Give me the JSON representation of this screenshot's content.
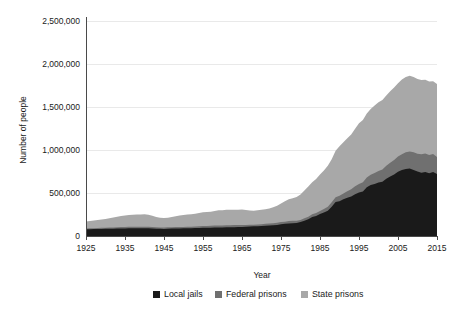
{
  "chart_data": {
    "type": "area",
    "stacked": true,
    "title": "",
    "xlabel": "Year",
    "ylabel": "Number of people",
    "xlim": [
      1925,
      2015
    ],
    "ylim": [
      0,
      2500000
    ],
    "grid": true,
    "legend_position": "bottom",
    "ytick_labels": [
      "2,500,000",
      "2,000,000",
      "1,500,000",
      "1,000,000",
      "500,000",
      "0"
    ],
    "ytick_values": [
      2500000,
      2000000,
      1500000,
      1000000,
      500000,
      0
    ],
    "xtick_labels": [
      "1925",
      "1935",
      "1945",
      "1955",
      "1965",
      "1975",
      "1985",
      "1995",
      "2005",
      "2015"
    ],
    "xtick_values": [
      1925,
      1935,
      1945,
      1955,
      1965,
      1975,
      1985,
      1995,
      2005,
      2015
    ],
    "x": [
      1925,
      1926,
      1927,
      1928,
      1929,
      1930,
      1931,
      1932,
      1933,
      1934,
      1935,
      1936,
      1937,
      1938,
      1939,
      1940,
      1941,
      1942,
      1943,
      1944,
      1945,
      1946,
      1947,
      1948,
      1949,
      1950,
      1951,
      1952,
      1953,
      1954,
      1955,
      1956,
      1957,
      1958,
      1959,
      1960,
      1961,
      1962,
      1963,
      1964,
      1965,
      1966,
      1967,
      1968,
      1969,
      1970,
      1971,
      1972,
      1973,
      1974,
      1975,
      1976,
      1977,
      1978,
      1979,
      1980,
      1981,
      1982,
      1983,
      1984,
      1985,
      1986,
      1987,
      1988,
      1989,
      1990,
      1991,
      1992,
      1993,
      1994,
      1995,
      1996,
      1997,
      1998,
      1999,
      2000,
      2001,
      2002,
      2003,
      2004,
      2005,
      2006,
      2007,
      2008,
      2009,
      2010,
      2011,
      2012,
      2013,
      2014,
      2015
    ],
    "series": [
      {
        "name": "Local jails",
        "color": "#1a1a1a",
        "values": [
          78000,
          79000,
          80000,
          81000,
          82000,
          83000,
          84000,
          85000,
          86000,
          87000,
          88000,
          89000,
          90000,
          90000,
          90000,
          90000,
          89000,
          87000,
          85000,
          83000,
          82000,
          84000,
          86000,
          87000,
          88000,
          89000,
          90000,
          91000,
          92000,
          93000,
          95000,
          96000,
          97000,
          98000,
          99000,
          100000,
          101000,
          102000,
          103000,
          104000,
          106000,
          108000,
          110000,
          112000,
          114000,
          117000,
          120000,
          123000,
          126000,
          129000,
          138000,
          141000,
          144000,
          147000,
          150000,
          163000,
          178000,
          196000,
          221000,
          234000,
          256000,
          274000,
          295000,
          341000,
          395000,
          405000,
          426000,
          444000,
          459000,
          486000,
          507000,
          518000,
          567000,
          592000,
          605000,
          621000,
          631000,
          665000,
          691000,
          714000,
          747000,
          766000,
          780000,
          785000,
          767000,
          749000,
          736000,
          745000,
          731000,
          745000,
          721000
        ]
      },
      {
        "name": "Federal prisons",
        "color": "#707070",
        "values": [
          9000,
          10000,
          11000,
          12000,
          13000,
          13000,
          14000,
          15000,
          16000,
          17000,
          18000,
          19000,
          19000,
          19000,
          19000,
          19000,
          19000,
          18000,
          17000,
          16000,
          16000,
          17000,
          17000,
          17000,
          17000,
          17000,
          17000,
          18000,
          19000,
          20000,
          20000,
          21000,
          22000,
          23000,
          23000,
          23000,
          24000,
          24000,
          24000,
          23000,
          22000,
          21000,
          20000,
          20000,
          20000,
          20000,
          21000,
          22000,
          23000,
          24000,
          24000,
          26000,
          29000,
          29000,
          26000,
          24000,
          27000,
          29000,
          31000,
          33000,
          36000,
          39000,
          45000,
          51000,
          57000,
          63000,
          68000,
          76000,
          84000,
          92000,
          99000,
          106000,
          113000,
          120000,
          127000,
          134000,
          143000,
          151000,
          161000,
          169000,
          177000,
          186000,
          194000,
          199000,
          206000,
          208000,
          216000,
          214000,
          212000,
          209000,
          197000
        ]
      },
      {
        "name": "State prisons",
        "color": "#a8a8a8",
        "values": [
          83000,
          86000,
          89000,
          93000,
          96000,
          103000,
          109000,
          116000,
          123000,
          128000,
          133000,
          136000,
          138000,
          140000,
          142000,
          144000,
          140000,
          131000,
          120000,
          113000,
          110000,
          112000,
          118000,
          125000,
          133000,
          139000,
          142000,
          143000,
          147000,
          155000,
          160000,
          163000,
          164000,
          170000,
          176000,
          177000,
          180000,
          178000,
          178000,
          177000,
          180000,
          172000,
          167000,
          162000,
          164000,
          167000,
          170000,
          174000,
          185000,
          198000,
          216000,
          238000,
          253000,
          263000,
          277000,
          295000,
          323000,
          350000,
          372000,
          396000,
          424000,
          449000,
          476000,
          501000,
          539000,
          575000,
          595000,
          616000,
          636000,
          670000,
          705000,
          725000,
          745000,
          765000,
          786000,
          799000,
          808000,
          817000,
          831000,
          843000,
          852000,
          867000,
          875000,
          880000,
          875000,
          869000,
          862000,
          857000,
          853000,
          846000,
          850000
        ]
      }
    ],
    "notes": {
      "peak_total": 2292000,
      "peak_year": 2008,
      "final_total_2015": 1768000,
      "grid_color": "#e9e9e9",
      "axis_color": "#4a4a4a"
    }
  },
  "legend": {
    "items": [
      {
        "label": "Local jails",
        "color": "#1a1a1a"
      },
      {
        "label": "Federal prisons",
        "color": "#707070"
      },
      {
        "label": "State prisons",
        "color": "#a8a8a8"
      }
    ]
  }
}
